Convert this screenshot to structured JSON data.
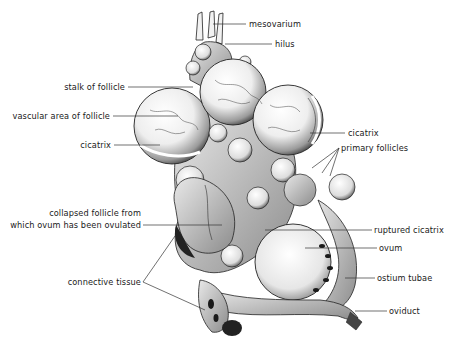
{
  "diagram": {
    "colors": {
      "ink": "#1a1a1a",
      "line": "#333333",
      "background": "#ffffff",
      "stipple": "#555555"
    },
    "labels": {
      "mesovarium": "mesovarium",
      "hilus": "hilus",
      "stalk_of_follicle": "stalk of follicle",
      "vascular_area_of_follicle": "vascular area of follicle",
      "cicatrix_left": "cicatrix",
      "cicatrix_right": "cicatrix",
      "primary_follicles": "primary follicles",
      "collapsed_follicle_line1": "collapsed follicle from",
      "collapsed_follicle_line2": "which ovum has been ovulated",
      "ruptured_cicatrix": "ruptured cicatrix",
      "ovum": "ovum",
      "ostium_tubae": "ostium tubae",
      "connective_tissue": "connective tissue",
      "oviduct": "oviduct"
    }
  }
}
